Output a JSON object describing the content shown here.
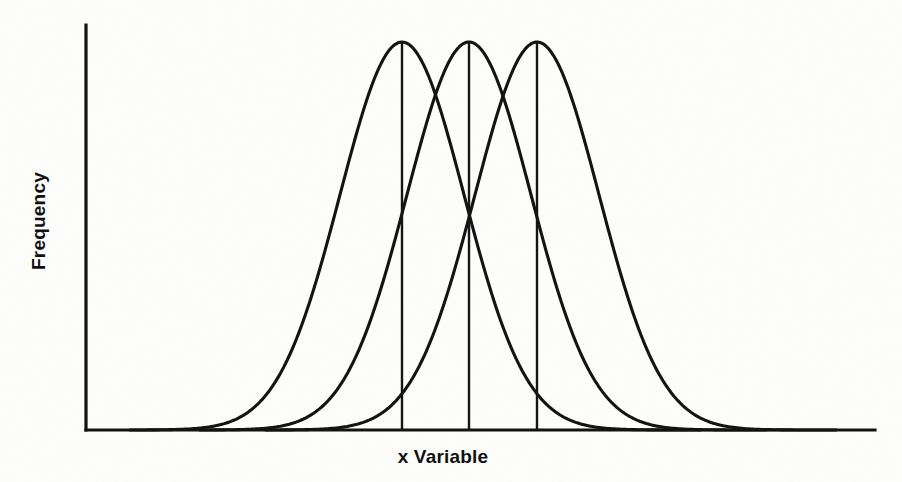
{
  "figure": {
    "kind": "statistics-textbook-figure",
    "background_color": "#fdfdfc",
    "ink_color": "#131313"
  },
  "axes": {
    "x_label": "x Variable",
    "y_label": "Frequency",
    "origin_px": {
      "x": 86,
      "y": 430
    },
    "x_axis_end_px": {
      "x": 875,
      "y": 430
    },
    "y_axis_top_px": {
      "x": 86,
      "y": 25
    }
  },
  "chart_data": {
    "type": "line",
    "title": "",
    "subtitle": "",
    "xlabel": "x Variable",
    "ylabel": "Frequency",
    "grid": false,
    "legend": false,
    "legend_position": "none",
    "xlim": [
      86,
      875
    ],
    "ylim": [
      0,
      1
    ],
    "x_tick_labels": [],
    "y_tick_labels": [],
    "annotations": [],
    "curve_shape": "gaussian",
    "peak_y_px": 42,
    "baseline_y_px": 430,
    "sigma_px": 62,
    "series": [
      {
        "name": "distribution-1",
        "mean_px": 402,
        "peak_px": {
          "x": 402,
          "y": 42
        },
        "left_foot_px": {
          "x": 130,
          "y": 430
        },
        "right_foot_px": {
          "x": 700,
          "y": 430
        },
        "height": 1.0,
        "sigma_px": 62,
        "has_mean_line": true
      },
      {
        "name": "distribution-2",
        "mean_px": 469,
        "peak_px": {
          "x": 469,
          "y": 42
        },
        "left_foot_px": {
          "x": 200,
          "y": 430
        },
        "right_foot_px": {
          "x": 766,
          "y": 430
        },
        "height": 1.0,
        "sigma_px": 62,
        "has_mean_line": true
      },
      {
        "name": "distribution-3",
        "mean_px": 537,
        "peak_px": {
          "x": 537,
          "y": 42
        },
        "left_foot_px": {
          "x": 266,
          "y": 430
        },
        "right_foot_px": {
          "x": 836,
          "y": 430
        },
        "height": 1.0,
        "sigma_px": 62,
        "has_mean_line": true
      }
    ],
    "mean_lines": [
      {
        "name": "mean-line-1",
        "x_px": 402,
        "from_y_px": 42,
        "to_y_px": 430
      },
      {
        "name": "mean-line-2",
        "x_px": 469,
        "from_y_px": 42,
        "to_y_px": 430
      },
      {
        "name": "mean-line-3",
        "x_px": 537,
        "from_y_px": 42,
        "to_y_px": 430
      }
    ]
  }
}
